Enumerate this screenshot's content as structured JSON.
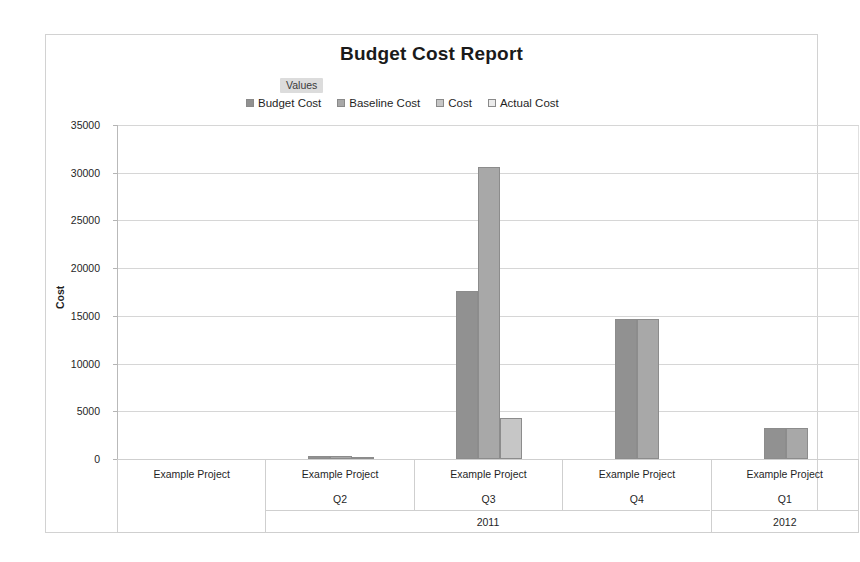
{
  "chart_data": {
    "type": "bar",
    "title": "Budget Cost Report",
    "xlabel": "",
    "ylabel": "Cost",
    "ylim": [
      0,
      35000
    ],
    "yticks": [
      0,
      5000,
      10000,
      15000,
      20000,
      25000,
      30000,
      35000
    ],
    "ytick_labels": [
      "0",
      "5000",
      "10000",
      "15000",
      "20000",
      "25000",
      "30000",
      "35000"
    ],
    "grid": true,
    "legend_position": "top-center",
    "legend_title": "Values",
    "categories": [
      "Example Project",
      "Example Project Q2 2011",
      "Example Project Q3 2011",
      "Example Project Q4 2011",
      "Example Project Q1 2012"
    ],
    "series": [
      {
        "name": "Budget Cost",
        "color": "#919191",
        "values": [
          0,
          300,
          17600,
          14700,
          3300
        ]
      },
      {
        "name": "Baseline Cost",
        "color": "#a8a8a8",
        "values": [
          0,
          300,
          30600,
          14700,
          3300
        ]
      },
      {
        "name": "Cost",
        "color": "#c6c6c6",
        "values": [
          0,
          250,
          4300,
          0,
          0
        ]
      },
      {
        "name": "Actual Cost",
        "color": "#ebebeb",
        "values": [
          0,
          0,
          0,
          0,
          0
        ]
      }
    ]
  },
  "axis_table": {
    "columns": [
      {
        "project": "Example Project",
        "quarter": "",
        "year": ""
      },
      {
        "project": "Example Project",
        "quarter": "Q2",
        "year": "2011"
      },
      {
        "project": "Example Project",
        "quarter": "Q3",
        "year": "2011"
      },
      {
        "project": "Example Project",
        "quarter": "Q4",
        "year": "2011"
      },
      {
        "project": "Example Project",
        "quarter": "Q1",
        "year": "2012"
      }
    ],
    "year_bands": [
      {
        "label": "2011",
        "start_col": 1,
        "span": 3
      },
      {
        "label": "2012",
        "start_col": 4,
        "span": 1
      }
    ]
  },
  "colors": {
    "frame_border": "#d2d2d2",
    "gridline": "#d6d6d6",
    "axis_line": "#b9b9b9",
    "legend_title_bg": "#dcdcdc",
    "text": "#1f1f1f",
    "background": "#ffffff"
  }
}
